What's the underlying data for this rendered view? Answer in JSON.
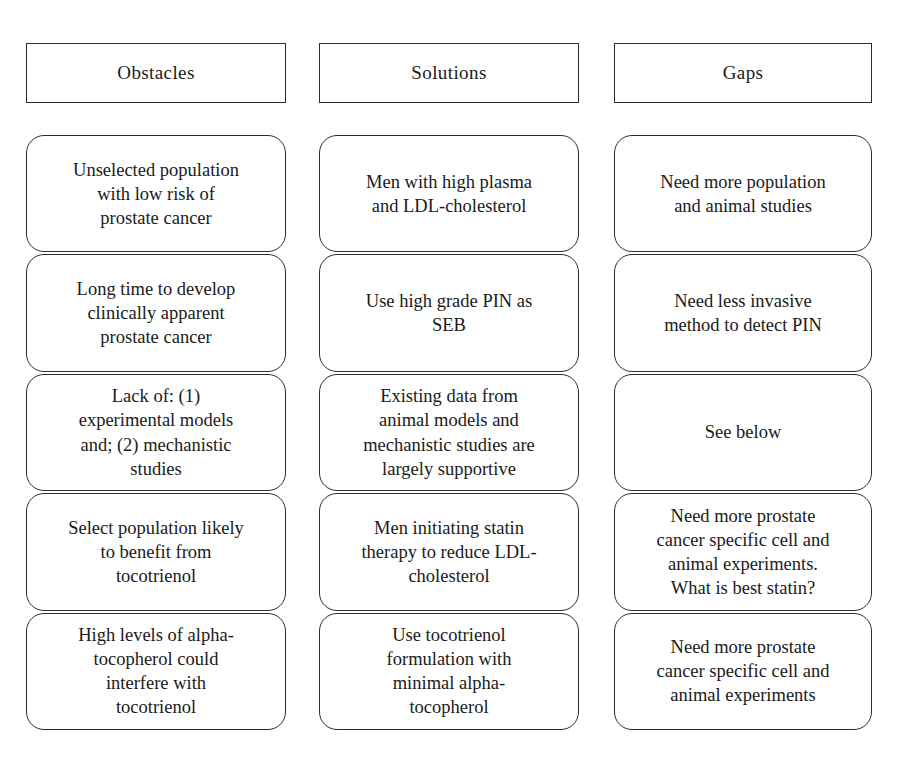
{
  "figure": {
    "kind": "three-column-table-diagram",
    "background_color": "#ffffff",
    "border_color": "#2b2b2b",
    "text_color": "#1a1a1a"
  },
  "columns": [
    {
      "header": "Obstacles",
      "cells": [
        "Unselected population\nwith low risk of\nprostate cancer",
        "Long time to develop\nclinically apparent\nprostate cancer",
        "Lack of: (1)\nexperimental models\nand; (2) mechanistic\nstudies",
        "Select population likely\nto benefit from\ntocotrienol",
        "High levels of alpha-\ntocopherol could\ninterfere with\ntocotrienol"
      ]
    },
    {
      "header": "Solutions",
      "cells": [
        "Men with high plasma\nand LDL-cholesterol",
        "Use high grade PIN as\nSEB",
        "Existing data from\nanimal models and\nmechanistic studies are\nlargely supportive",
        "Men initiating statin\ntherapy to reduce LDL-\ncholesterol",
        "Use tocotrienol\nformulation with\nminimal alpha-\ntocopherol"
      ]
    },
    {
      "header": "Gaps",
      "cells": [
        "Need more population\nand animal studies",
        "Need less invasive\nmethod to detect PIN",
        "See below",
        "Need more prostate\ncancer specific cell and\nanimal experiments.\nWhat is best statin?",
        "Need more prostate\ncancer specific cell and\nanimal experiments"
      ]
    }
  ]
}
